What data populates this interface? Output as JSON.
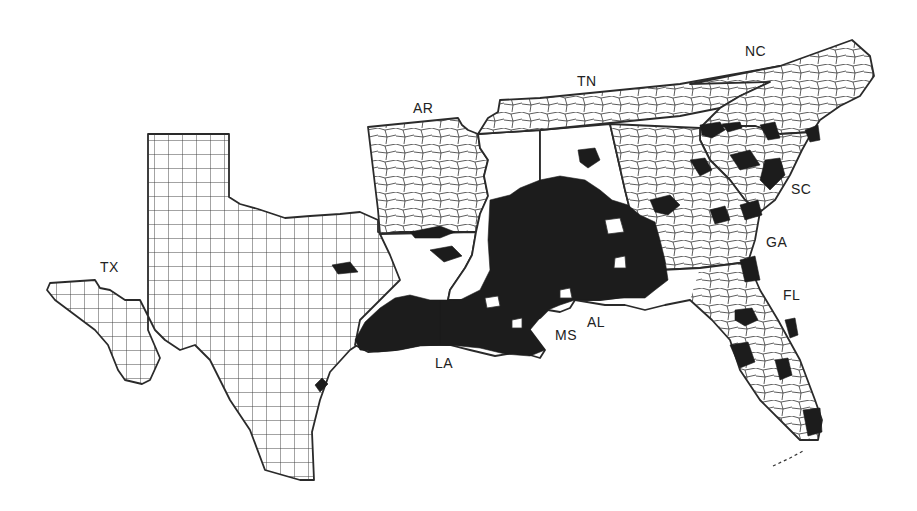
{
  "map": {
    "type": "county choropleth",
    "region": "Southeastern United States",
    "fill_colors": {
      "shaded": "#1c1c1c",
      "unshaded": "#ffffff",
      "boundary": "#2a2a2a"
    },
    "state_labels": [
      {
        "id": "tx",
        "text": "TX",
        "x": 100,
        "y": 259
      },
      {
        "id": "ar",
        "text": "AR",
        "x": 413,
        "y": 100
      },
      {
        "id": "tn",
        "text": "TN",
        "x": 577,
        "y": 73
      },
      {
        "id": "nc",
        "text": "NC",
        "x": 745,
        "y": 43
      },
      {
        "id": "sc",
        "text": "SC",
        "x": 791,
        "y": 181
      },
      {
        "id": "ga",
        "text": "GA",
        "x": 766,
        "y": 234
      },
      {
        "id": "fl",
        "text": "FL",
        "x": 783,
        "y": 287
      },
      {
        "id": "la",
        "text": "LA",
        "x": 435,
        "y": 355
      },
      {
        "id": "ms",
        "text": "MS",
        "x": 555,
        "y": 327
      },
      {
        "id": "al",
        "text": "AL",
        "x": 587,
        "y": 314
      }
    ]
  }
}
